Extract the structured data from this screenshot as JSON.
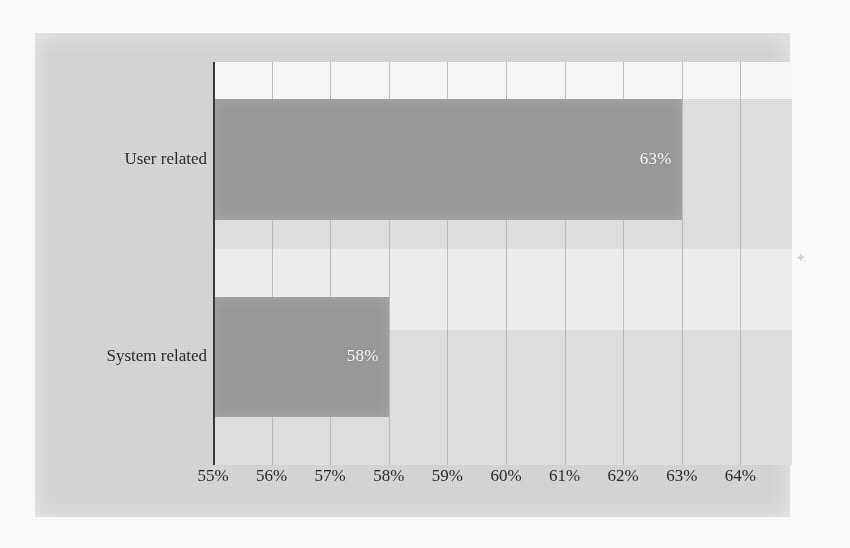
{
  "chart_data": {
    "type": "bar",
    "orientation": "horizontal",
    "title": "",
    "subtitle": "",
    "xlabel": "",
    "ylabel": "",
    "categories": [
      "User related",
      "System related"
    ],
    "values": [
      63,
      58
    ],
    "value_labels": [
      "63%",
      "58%"
    ],
    "xlim": [
      55,
      64
    ],
    "xticks": [
      55,
      56,
      57,
      58,
      59,
      60,
      61,
      62,
      63,
      64
    ],
    "xtick_labels": [
      "55%",
      "56%",
      "57%",
      "58%",
      "59%",
      "60%",
      "61%",
      "62%",
      "63%",
      "64%"
    ],
    "grid": "vertical",
    "legend": "none",
    "series": [
      {
        "name": "",
        "values": [
          63,
          58
        ]
      }
    ],
    "bars": [
      {
        "category": "User related",
        "value": 63,
        "label": "63%"
      },
      {
        "category": "System related",
        "value": 58,
        "label": "58%"
      }
    ]
  },
  "colors": {
    "bar_fill": "#9b9b9b",
    "value_label_text": "#ffffff",
    "axis_line": "#3a3a3a",
    "gridline": "#b6b6b6",
    "plot_background_upper": "#fbfbfb",
    "plot_background_mid": "#f1f1f1",
    "plot_background_lower": "#e2e2e2",
    "figure_background": "#d8d8d8",
    "page_background": "#ffffff",
    "tick_text": "#2b2b2b",
    "category_text": "#2b2b2b"
  },
  "icons": {
    "scan-speck": "scan-artifact-speck"
  }
}
